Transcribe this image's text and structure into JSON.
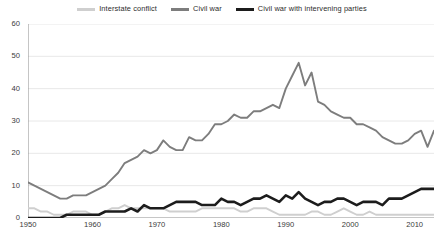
{
  "chart_data": {
    "type": "line",
    "title": "",
    "subtitle": "",
    "xlabel": "",
    "ylabel": "",
    "xlim": [
      1950,
      2013
    ],
    "ylim": [
      0,
      60
    ],
    "yticks": [
      0,
      10,
      20,
      30,
      40,
      50,
      60
    ],
    "xticks": [
      1950,
      1960,
      1970,
      1980,
      1990,
      2000,
      2010
    ],
    "grid": true,
    "legend_position": "top",
    "x": [
      1950,
      1951,
      1952,
      1953,
      1954,
      1955,
      1956,
      1957,
      1958,
      1959,
      1960,
      1961,
      1962,
      1963,
      1964,
      1965,
      1966,
      1967,
      1968,
      1969,
      1970,
      1971,
      1972,
      1973,
      1974,
      1975,
      1976,
      1977,
      1978,
      1979,
      1980,
      1981,
      1982,
      1983,
      1984,
      1985,
      1986,
      1987,
      1988,
      1989,
      1990,
      1991,
      1992,
      1993,
      1994,
      1995,
      1996,
      1997,
      1998,
      1999,
      2000,
      2001,
      2002,
      2003,
      2004,
      2005,
      2006,
      2007,
      2008,
      2009,
      2010,
      2011,
      2012,
      2013
    ],
    "series": [
      {
        "name": "Interstate conflict",
        "color": "#cfcfcf",
        "values": [
          3,
          3,
          2,
          2,
          1,
          1,
          1,
          2,
          2,
          2,
          1,
          1,
          2,
          3,
          3,
          4,
          3,
          3,
          3,
          3,
          3,
          3,
          2,
          2,
          2,
          2,
          2,
          3,
          3,
          3,
          3,
          3,
          3,
          2,
          2,
          3,
          3,
          3,
          2,
          1,
          1,
          1,
          1,
          1,
          2,
          2,
          1,
          1,
          2,
          3,
          2,
          1,
          1,
          2,
          1,
          1,
          1,
          1,
          1,
          1,
          1,
          1,
          1,
          1
        ]
      },
      {
        "name": "Civil war",
        "color": "#7d7d7d",
        "values": [
          11,
          10,
          9,
          8,
          7,
          6,
          6,
          7,
          7,
          7,
          8,
          9,
          10,
          12,
          14,
          17,
          18,
          19,
          21,
          20,
          21,
          24,
          22,
          21,
          21,
          25,
          24,
          24,
          26,
          29,
          29,
          30,
          32,
          31,
          31,
          33,
          33,
          34,
          35,
          34,
          40,
          44,
          48,
          41,
          45,
          36,
          35,
          33,
          32,
          31,
          31,
          29,
          29,
          28,
          27,
          25,
          24,
          23,
          23,
          24,
          26,
          27,
          22,
          27
        ]
      },
      {
        "name": "Civil war with intervening parties",
        "color": "#1c1c1c",
        "values": [
          0,
          0,
          0,
          0,
          0,
          0,
          1,
          1,
          1,
          1,
          1,
          1,
          2,
          2,
          2,
          2,
          3,
          2,
          4,
          3,
          3,
          3,
          4,
          5,
          5,
          5,
          5,
          4,
          4,
          4,
          6,
          5,
          5,
          4,
          5,
          6,
          6,
          7,
          6,
          5,
          7,
          6,
          8,
          6,
          5,
          4,
          5,
          5,
          6,
          6,
          5,
          4,
          5,
          5,
          5,
          4,
          6,
          6,
          6,
          7,
          8,
          9,
          9,
          9
        ]
      }
    ]
  },
  "legend": {
    "items": [
      {
        "label": "Interstate conflict",
        "color": "#cfcfcf"
      },
      {
        "label": "Civil war",
        "color": "#7d7d7d"
      },
      {
        "label": "Civil war with intervening parties",
        "color": "#1c1c1c"
      }
    ]
  },
  "axes": {
    "y_tick_labels": [
      "0",
      "10",
      "20",
      "30",
      "40",
      "50",
      "60"
    ],
    "x_tick_labels": [
      "1950",
      "1960",
      "1970",
      "1980",
      "1990",
      "2000",
      "2010"
    ]
  },
  "colors": {
    "grid": "#e8e8e8",
    "axis": "#8c8c8c",
    "text": "#3a3a3a",
    "background": "#ffffff"
  }
}
